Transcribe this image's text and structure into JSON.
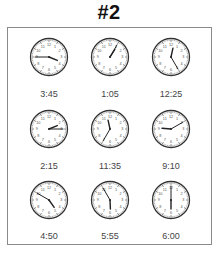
{
  "title": "#2",
  "clocks": [
    {
      "label": "3:45",
      "hour": 3,
      "minute": 45
    },
    {
      "label": "1:05",
      "hour": 1,
      "minute": 5
    },
    {
      "label": "12:25",
      "hour": 12,
      "minute": 25
    },
    {
      "label": "2:15",
      "hour": 2,
      "minute": 15
    },
    {
      "label": "11:35",
      "hour": 11,
      "minute": 35
    },
    {
      "label": "9:10",
      "hour": 9,
      "minute": 10
    },
    {
      "label": "4:50",
      "hour": 4,
      "minute": 50
    },
    {
      "label": "5:55",
      "hour": 5,
      "minute": 55
    },
    {
      "label": "6:00",
      "hour": 6,
      "minute": 0
    }
  ],
  "dial_numbers": [
    "12",
    "1",
    "2",
    "3",
    "4",
    "5",
    "6",
    "7",
    "8",
    "9",
    "10",
    "11"
  ],
  "colors": {
    "frame": "#8a8a8a",
    "clock_rim": "#333333",
    "hands": "#222222",
    "label": "#444444"
  }
}
